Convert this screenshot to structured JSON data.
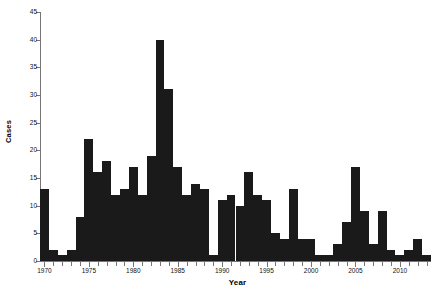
{
  "chart_data": {
    "type": "bar",
    "title": "",
    "xlabel": "Year",
    "ylabel": "Cases",
    "xlim": [
      1969.5,
      2013.5
    ],
    "ylim": [
      0,
      45
    ],
    "grid": false,
    "legend": null,
    "y_ticks": [
      0,
      5,
      10,
      15,
      20,
      25,
      30,
      35,
      40,
      45
    ],
    "x_ticks_major": [
      1970,
      1975,
      1980,
      1985,
      1990,
      1995,
      2000,
      2005,
      2010
    ],
    "x_tick_interval": 1,
    "bar_color": "#1a1a1a",
    "axis_color": "#767676",
    "categories": [
      1970,
      1971,
      1972,
      1973,
      1974,
      1975,
      1976,
      1977,
      1978,
      1979,
      1980,
      1981,
      1982,
      1983,
      1984,
      1985,
      1986,
      1987,
      1988,
      1989,
      1990,
      1991,
      1992,
      1993,
      1994,
      1995,
      1996,
      1997,
      1998,
      1999,
      2000,
      2001,
      2002,
      2003,
      2004,
      2005,
      2006,
      2007,
      2008,
      2009,
      2010,
      2011,
      2012,
      2013
    ],
    "values": [
      13,
      2,
      1,
      2,
      8,
      22,
      16,
      18,
      12,
      13,
      17,
      12,
      19,
      40,
      31,
      17,
      12,
      14,
      13,
      1,
      11,
      12,
      10,
      16,
      12,
      11,
      5,
      4,
      13,
      4,
      4,
      1,
      1,
      3,
      7,
      17,
      9,
      3,
      9,
      2,
      1,
      2,
      4,
      1
    ]
  }
}
